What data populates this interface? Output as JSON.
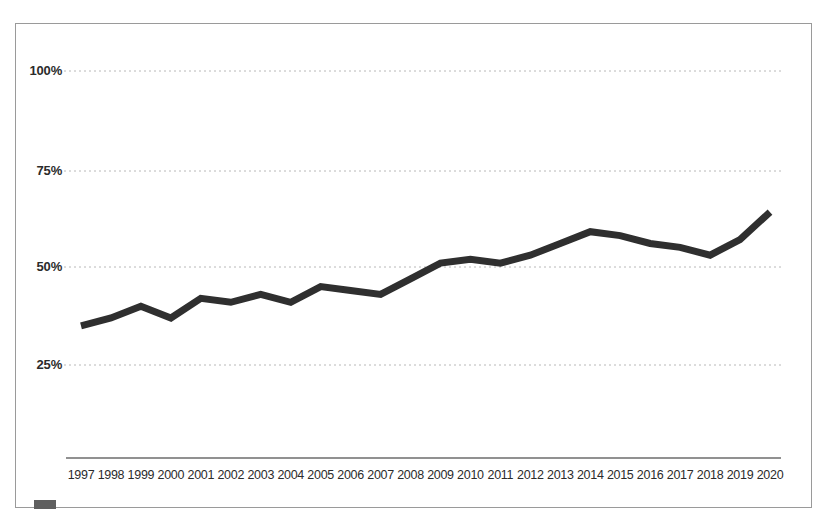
{
  "chart_data": {
    "type": "line",
    "title": "",
    "subtitle": "",
    "xlabel": "",
    "ylabel": "",
    "grid": true,
    "legend_position": "bottom-left",
    "ylim": [
      0,
      110
    ],
    "yticks": [
      "25%",
      "50%",
      "75%",
      "100%"
    ],
    "ytick_values": [
      25,
      50,
      75,
      100
    ],
    "categories": [
      "1997",
      "1998",
      "1999",
      "2000",
      "2001",
      "2002",
      "2003",
      "2004",
      "2005",
      "2006",
      "2007",
      "2008",
      "2009",
      "2010",
      "2011",
      "2012",
      "2013",
      "2014",
      "2015",
      "2016",
      "2017",
      "2018",
      "2019",
      "2020"
    ],
    "series": [
      {
        "name": "",
        "color": "#2f2f2f",
        "values": [
          35,
          37,
          40,
          37,
          42,
          41,
          43,
          41,
          45,
          44,
          43,
          47,
          51,
          52,
          51,
          53,
          56,
          59,
          58,
          56,
          55,
          53,
          57,
          64
        ]
      }
    ]
  },
  "axis": {
    "ytick_labels": [
      "100%",
      "75%",
      "50%",
      "25%"
    ],
    "xtick_labels": [
      "1997",
      "1998",
      "1999",
      "2000",
      "2001",
      "2002",
      "2003",
      "2004",
      "2005",
      "2006",
      "2007",
      "2008",
      "2009",
      "2010",
      "2011",
      "2012",
      "2013",
      "2014",
      "2015",
      "2016",
      "2017",
      "2018",
      "2019",
      "2020"
    ]
  },
  "legend": {
    "label": ""
  }
}
